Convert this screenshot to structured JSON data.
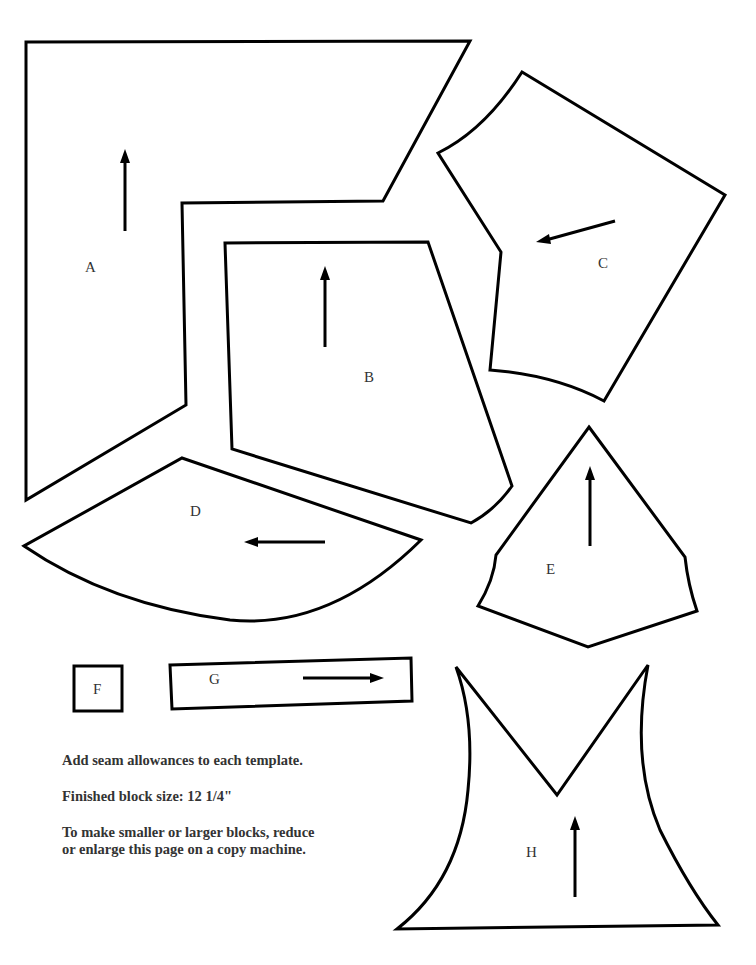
{
  "pieces": {
    "A": {
      "label": "A"
    },
    "B": {
      "label": "B"
    },
    "C": {
      "label": "C"
    },
    "D": {
      "label": "D"
    },
    "E": {
      "label": "E"
    },
    "F": {
      "label": "F"
    },
    "G": {
      "label": "G"
    },
    "H": {
      "label": "H"
    }
  },
  "notes": {
    "seam": "Add seam allowances to each template.",
    "size": "Finished block size: 12 1/4\"",
    "resize_line1": "To make smaller or larger blocks, reduce",
    "resize_line2": "or enlarge this page on a copy machine."
  },
  "colors": {
    "stroke": "#000000",
    "text": "#333333",
    "background": "#ffffff"
  }
}
